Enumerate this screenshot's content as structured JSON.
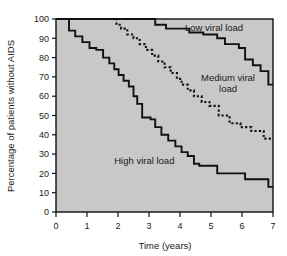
{
  "chart_data": {
    "type": "line",
    "subtype": "kaplan-meier-step",
    "title": "",
    "xlabel": "Time (years)",
    "ylabel": "Percentage of patients without AIDS",
    "xlim": [
      0,
      7
    ],
    "ylim": [
      0,
      100
    ],
    "xticks": [
      0,
      1,
      2,
      3,
      4,
      5,
      6,
      7
    ],
    "yticks": [
      0,
      10,
      20,
      30,
      40,
      50,
      60,
      70,
      80,
      90,
      100
    ],
    "xtick_labels": [
      "0",
      "1",
      "2",
      "3",
      "4",
      "5",
      "6",
      "7"
    ],
    "ytick_labels": [
      "0",
      "10",
      "20",
      "30",
      "40",
      "50",
      "60",
      "70",
      "80",
      "90",
      "100"
    ],
    "grid": false,
    "legend_position": "inline-annotations",
    "plot_background": "#c8c8c8",
    "line_color": "#111111",
    "series": [
      {
        "name": "Low viral load",
        "style": "solid",
        "label_text": "Low viral load",
        "label_lines": [
          "Low viral load"
        ],
        "x": [
          0.0,
          3.2,
          3.2,
          3.55,
          3.55,
          4.3,
          4.3,
          4.75,
          4.75,
          5.2,
          5.2,
          5.45,
          5.45,
          5.9,
          5.9,
          6.1,
          6.1,
          6.35,
          6.35,
          6.6,
          6.6,
          6.85,
          6.85,
          7.0
        ],
        "y": [
          100,
          100,
          97,
          97,
          95,
          95,
          93,
          93,
          92,
          92,
          90,
          90,
          87,
          87,
          85,
          85,
          79,
          79,
          76,
          76,
          73,
          73,
          66,
          66
        ],
        "final_value": 66
      },
      {
        "name": "Medium viral load",
        "style": "dotted",
        "label_text": "Medium viral load",
        "label_lines": [
          "Medium viral",
          "load"
        ],
        "x": [
          1.78,
          1.95,
          1.95,
          2.1,
          2.1,
          2.3,
          2.3,
          2.5,
          2.5,
          2.7,
          2.7,
          2.9,
          2.9,
          3.1,
          3.1,
          3.3,
          3.3,
          3.5,
          3.5,
          3.7,
          3.7,
          3.9,
          3.9,
          4.05,
          4.05,
          4.25,
          4.25,
          4.45,
          4.45,
          4.7,
          4.7,
          4.95,
          4.95,
          5.25,
          5.25,
          5.6,
          5.6,
          5.95,
          5.95,
          6.3,
          6.3,
          6.7,
          6.7,
          7.0
        ],
        "y": [
          100,
          100,
          97,
          97,
          95,
          95,
          92,
          92,
          90,
          90,
          87,
          87,
          84,
          84,
          81,
          81,
          78,
          78,
          75,
          75,
          72,
          72,
          69,
          69,
          66,
          66,
          63,
          63,
          60,
          60,
          57,
          57,
          55,
          55,
          50,
          50,
          46,
          46,
          44,
          44,
          42,
          42,
          38,
          38
        ],
        "final_value": 38
      },
      {
        "name": "High viral load",
        "style": "solid",
        "label_text": "High viral load",
        "label_lines": [
          "High viral load"
        ],
        "x": [
          0.0,
          0.42,
          0.42,
          0.62,
          0.62,
          0.85,
          0.85,
          1.08,
          1.08,
          1.3,
          1.3,
          1.52,
          1.52,
          1.72,
          1.72,
          1.88,
          1.88,
          2.02,
          2.02,
          2.18,
          2.18,
          2.35,
          2.35,
          2.5,
          2.5,
          2.62,
          2.62,
          2.78,
          2.78,
          3.05,
          3.05,
          3.2,
          3.2,
          3.4,
          3.4,
          3.62,
          3.62,
          3.85,
          3.85,
          4.05,
          4.05,
          4.25,
          4.25,
          4.45,
          4.45,
          4.62,
          4.62,
          5.2,
          5.2,
          6.1,
          6.1,
          6.85,
          6.85,
          7.0
        ],
        "y": [
          100,
          100,
          94,
          94,
          91,
          91,
          88,
          88,
          85,
          85,
          84,
          84,
          80,
          80,
          77,
          77,
          74,
          74,
          71,
          71,
          68,
          68,
          65,
          65,
          60,
          60,
          56,
          56,
          49,
          49,
          48,
          48,
          44,
          44,
          40,
          40,
          37,
          37,
          34,
          34,
          31,
          31,
          29,
          29,
          25,
          25,
          24,
          24,
          20,
          20,
          17,
          17,
          13,
          13
        ],
        "final_value": 13
      }
    ],
    "annotations": [
      {
        "name": "low-viral-load-label",
        "text": "Low viral load",
        "x": 5.1,
        "y": 94
      },
      {
        "name": "medium-viral-load-label",
        "text": "Medium viral load",
        "x": 5.55,
        "y": 68
      },
      {
        "name": "high-viral-load-label",
        "text": "High viral load",
        "x": 2.85,
        "y": 25
      }
    ]
  }
}
